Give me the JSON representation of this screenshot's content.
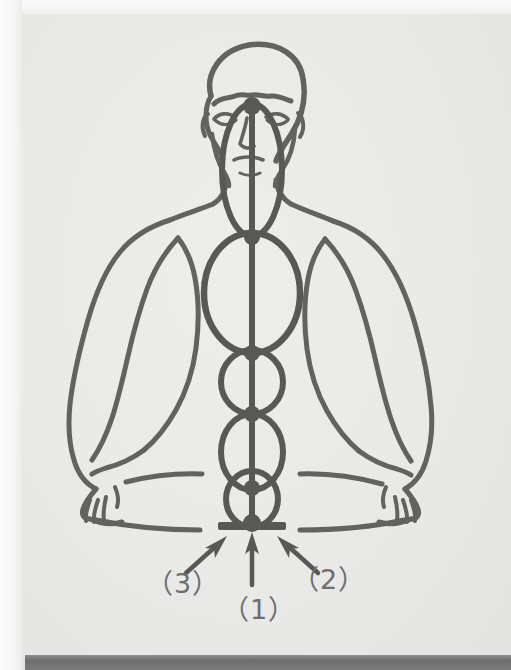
{
  "figure": {
    "kind": "line-drawing",
    "overlay": "vertical central channel with a chain of elliptical energy centers (chakras) from the head down to a base plate",
    "ink_color": "#63625f",
    "paper_color": "#eaeae8",
    "label_color": "#6e6e6e",
    "bottom_bar_color": "#767676"
  },
  "callouts": [
    {
      "id": "1",
      "text": "（1）",
      "arrow": "vertical arrow pointing up to the base plate below the lowest center"
    },
    {
      "id": "2",
      "text": "（2）",
      "arrow": "diagonal arrow from lower-right pointing up-left to the base area"
    },
    {
      "id": "3",
      "text": "（3）",
      "arrow": "diagonal arrow from lower-left pointing up-right to the base area"
    }
  ],
  "labels": {
    "one": "（1）",
    "two": "（2）",
    "three": "（3）"
  },
  "energy_centers": [
    {
      "index": 1,
      "name": "head-center",
      "cy": 170,
      "rx": 30,
      "ry": 66
    },
    {
      "index": 2,
      "name": "chest-center",
      "cy": 290,
      "rx": 48,
      "ry": 62
    },
    {
      "index": 3,
      "name": "upper-abdomen-center",
      "cy": 375,
      "rx": 32,
      "ry": 42
    },
    {
      "index": 4,
      "name": "lower-abdomen-center",
      "cy": 445,
      "rx": 32,
      "ry": 42
    },
    {
      "index": 5,
      "name": "base-center",
      "cy": 500,
      "rx": 25,
      "ry": 27
    }
  ]
}
